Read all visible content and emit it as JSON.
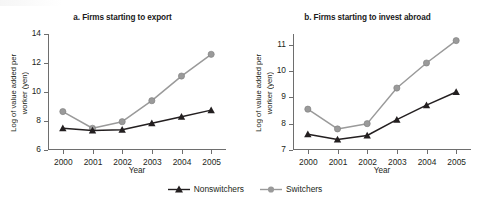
{
  "figure": {
    "xlabel": "Year",
    "ylabel_line1": "Log of value added per",
    "ylabel_line2": "worker (yen)",
    "legend": [
      {
        "label": "Nonswitchers",
        "color": "#231f20",
        "marker": "triangle"
      },
      {
        "label": "Switchers",
        "color": "#9a9a9a",
        "marker": "circle"
      }
    ]
  },
  "chart_data": [
    {
      "type": "line",
      "panel": "a",
      "title": "a. Firms starting to export",
      "xlabel": "Year",
      "ylabel": "Log of value added per worker (yen)",
      "categories": [
        "2000",
        "2001",
        "2002",
        "2003",
        "2004",
        "2005"
      ],
      "x": [
        2000,
        2001,
        2002,
        2003,
        2004,
        2005
      ],
      "ylim": [
        6,
        14
      ],
      "yticks": [
        6,
        8,
        10,
        12,
        14
      ],
      "grid": false,
      "legend_position": "bottom-center-shared",
      "series": [
        {
          "name": "Nonswitchers",
          "color": "#231f20",
          "marker": "triangle",
          "values": [
            7.5,
            7.35,
            7.4,
            7.85,
            8.3,
            8.75
          ]
        },
        {
          "name": "Switchers",
          "color": "#9a9a9a",
          "marker": "circle",
          "values": [
            8.65,
            7.5,
            7.95,
            9.4,
            11.1,
            12.6
          ]
        }
      ]
    },
    {
      "type": "line",
      "panel": "b",
      "title": "b. Firms starting to invest abroad",
      "xlabel": "Year",
      "ylabel": "Log of value added per worker (yen)",
      "categories": [
        "2000",
        "2001",
        "2002",
        "2003",
        "2004",
        "2005"
      ],
      "x": [
        2000,
        2001,
        2002,
        2003,
        2004,
        2005
      ],
      "ylim": [
        7,
        11.4
      ],
      "yticks": [
        7,
        8,
        9,
        10,
        11
      ],
      "grid": false,
      "legend_position": "bottom-center-shared",
      "series": [
        {
          "name": "Nonswitchers",
          "color": "#231f20",
          "marker": "triangle",
          "values": [
            7.6,
            7.4,
            7.55,
            8.15,
            8.7,
            9.2
          ]
        },
        {
          "name": "Switchers",
          "color": "#9a9a9a",
          "marker": "circle",
          "values": [
            8.55,
            7.8,
            8.0,
            9.35,
            10.3,
            11.15
          ]
        }
      ]
    }
  ]
}
